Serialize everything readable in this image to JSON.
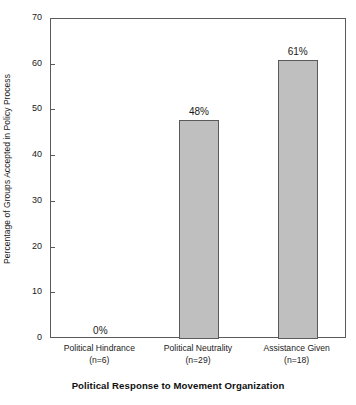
{
  "chart_data": {
    "type": "bar",
    "title": "",
    "xlabel": "Political Response to Movement Organization",
    "ylabel": "Percentage of Groups Accepted in Policy Process",
    "categories": [
      "Political Hindrance",
      "Political Neutrality",
      "Assistance Given"
    ],
    "category_sublabels": [
      "(n=6)",
      "(n=29)",
      "(n=18)"
    ],
    "sample_sizes": [
      6,
      29,
      18
    ],
    "values": [
      0,
      48,
      61
    ],
    "data_labels": [
      "0%",
      "48%",
      "61%"
    ],
    "ylim": [
      0,
      70
    ],
    "yticks": [
      0,
      10,
      20,
      30,
      40,
      50,
      60,
      70
    ],
    "ytick_labels": [
      "0",
      "10",
      "20",
      "30",
      "40",
      "50",
      "60",
      "70"
    ],
    "grid": false,
    "legend": false,
    "legend_position": "none",
    "bar_fill_color": "#bfbfbf",
    "bar_edge_color": "#5a5a5a",
    "axis_color": "#5a5a5a",
    "background_color": "#ffffff",
    "text_color": "#1a1a1a"
  }
}
